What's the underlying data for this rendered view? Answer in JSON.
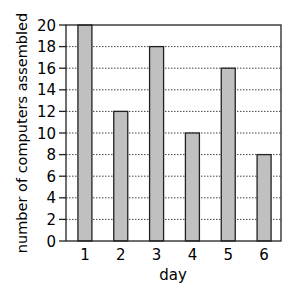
{
  "chart_data": {
    "type": "bar",
    "title": "",
    "xlabel": "day",
    "ylabel": "number of computers assembled",
    "categories": [
      "1",
      "2",
      "3",
      "4",
      "5",
      "6"
    ],
    "values": [
      20,
      12,
      18,
      10,
      16,
      8
    ],
    "ylim": [
      0,
      20
    ],
    "yticks": [
      0,
      2,
      4,
      6,
      8,
      10,
      12,
      14,
      16,
      18,
      20
    ],
    "grid": "horizontal dotted",
    "legend": null,
    "colors": {
      "bar_fill": "#c0c0c0",
      "bar_stroke": "#222222",
      "axis": "#222222",
      "grid": "#444444"
    }
  }
}
